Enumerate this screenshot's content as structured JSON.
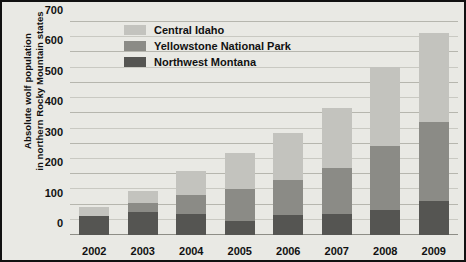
{
  "chart_data": {
    "type": "bar",
    "stacked": true,
    "title": "",
    "xlabel": "",
    "ylabel": "Absolute wolf population in northern Rocky Mountain states",
    "ylabel_lines": [
      "Absolute wolf population",
      "in northern Rocky Mountain states"
    ],
    "categories": [
      "2002",
      "2003",
      "2004",
      "2005",
      "2006",
      "2007",
      "2008",
      "2009"
    ],
    "ylim": [
      0,
      700
    ],
    "yticks": [
      0,
      100,
      200,
      300,
      400,
      500,
      600,
      700
    ],
    "ytick_labels": [
      "0",
      "100",
      "200",
      "300",
      "400",
      "500",
      "600",
      "700"
    ],
    "minor_gridlines": true,
    "minor_tick_step": 50,
    "grid": true,
    "legend_position": "top-left-inside",
    "series": [
      {
        "name": "Central Idaho",
        "color": "#c3c3be",
        "values": [
          30,
          40,
          79,
          118,
          153,
          199,
          259,
          294
        ]
      },
      {
        "name": "Yellowstone National Park",
        "color": "#8b8b86",
        "values": [
          0,
          30,
          60,
          105,
          116,
          149,
          209,
          258
        ]
      },
      {
        "name": "Northwest Montana",
        "color": "#555552",
        "values": [
          63,
          76,
          70,
          47,
          66,
          70,
          83,
          113
        ]
      }
    ],
    "totals": [
      93,
      146,
      209,
      270,
      335,
      418,
      551,
      665
    ]
  },
  "style": {
    "plot_background": "#e9e9e4",
    "border_color": "#111111",
    "gridline_color": "#c9c9c2",
    "text_color": "#111111"
  }
}
